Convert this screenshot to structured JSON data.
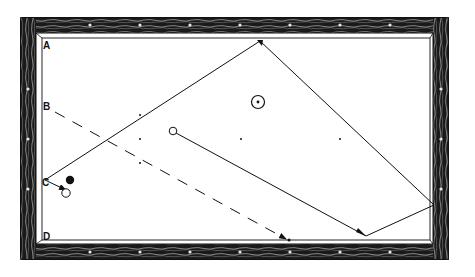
{
  "diagram": {
    "colors": {
      "ink": "#111111",
      "paper": "#ffffff",
      "frame": "#1a1a1a"
    },
    "labels": [
      {
        "id": "A",
        "text": "A"
      },
      {
        "id": "B",
        "text": "B"
      },
      {
        "id": "C",
        "text": "C"
      },
      {
        "id": "D",
        "text": "D"
      }
    ],
    "balls": [
      {
        "id": "cue-ball",
        "style": "open"
      },
      {
        "id": "object-ball-spot",
        "style": "spotted"
      },
      {
        "id": "object-ball-black",
        "style": "solid"
      },
      {
        "id": "object-ball-white",
        "style": "open"
      }
    ],
    "paths": [
      {
        "id": "cue-ball-path",
        "style": "solid",
        "segments": 4,
        "description": "Cue ball travels to bottom rail, right rail, top rail, then to C"
      },
      {
        "id": "object-ball-path",
        "style": "dashed",
        "description": "Ball from B travels to bottom rail near D side"
      }
    ],
    "diamond_markers": 5
  }
}
